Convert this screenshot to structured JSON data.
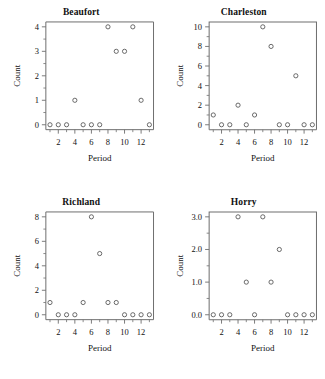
{
  "figure": {
    "layout": "2x2-panel-grid",
    "background": "#ffffff",
    "marker_color": "#5a5a5a",
    "axis_color": "#6e6e6e"
  },
  "chart_data": [
    {
      "type": "scatter",
      "title": "Beaufort",
      "xlabel": "Period",
      "ylabel": "Count",
      "x": [
        1,
        2,
        3,
        4,
        5,
        6,
        7,
        8,
        9,
        10,
        11,
        12,
        13
      ],
      "values": [
        0,
        0,
        0,
        1,
        0,
        0,
        0,
        4,
        3,
        3,
        4,
        1,
        0
      ],
      "xlim": [
        0.5,
        13.5
      ],
      "ylim": [
        -0.2,
        4.2
      ],
      "xticks": [
        2,
        4,
        6,
        8,
        10,
        12
      ],
      "xticklabels": [
        "2",
        "4",
        "6",
        "8",
        "10",
        "12"
      ],
      "xminorticks": [
        1,
        3,
        5,
        7,
        9,
        11,
        13
      ],
      "yticks": [
        0,
        1,
        2,
        3,
        4
      ],
      "yticklabels": [
        "0",
        "1",
        "2",
        "3",
        "4"
      ],
      "yminorticks": [
        0.5,
        1.5,
        2.5,
        3.5
      ],
      "grid": false,
      "legend": "none"
    },
    {
      "type": "scatter",
      "title": "Charleston",
      "xlabel": "Period",
      "ylabel": "Count",
      "x": [
        1,
        2,
        3,
        4,
        5,
        6,
        7,
        8,
        9,
        10,
        11,
        12,
        13
      ],
      "values": [
        1,
        0,
        0,
        2,
        0,
        1,
        10,
        8,
        0,
        0,
        5,
        0,
        0
      ],
      "xlim": [
        0.5,
        13.5
      ],
      "ylim": [
        -0.5,
        10.5
      ],
      "xticks": [
        2,
        4,
        6,
        8,
        10,
        12
      ],
      "xticklabels": [
        "2",
        "4",
        "6",
        "8",
        "10",
        "12"
      ],
      "xminorticks": [
        1,
        3,
        5,
        7,
        9,
        11,
        13
      ],
      "yticks": [
        0,
        2,
        4,
        6,
        8,
        10
      ],
      "yticklabels": [
        "0",
        "2",
        "4",
        "6",
        "8",
        "10"
      ],
      "yminorticks": [
        1,
        3,
        5,
        7,
        9
      ],
      "grid": false,
      "legend": "none"
    },
    {
      "type": "scatter",
      "title": "Richland",
      "xlabel": "Period",
      "ylabel": "Count",
      "x": [
        1,
        2,
        3,
        4,
        5,
        6,
        7,
        8,
        9,
        10,
        11,
        12,
        13
      ],
      "values": [
        1,
        0,
        0,
        0,
        1,
        8,
        5,
        1,
        1,
        0,
        0,
        0,
        0
      ],
      "xlim": [
        0.5,
        13.5
      ],
      "ylim": [
        -0.4,
        8.4
      ],
      "xticks": [
        2,
        4,
        6,
        8,
        10,
        12
      ],
      "xticklabels": [
        "2",
        "4",
        "6",
        "8",
        "10",
        "12"
      ],
      "xminorticks": [
        1,
        3,
        5,
        7,
        9,
        11,
        13
      ],
      "yticks": [
        0,
        2,
        4,
        6,
        8
      ],
      "yticklabels": [
        "0",
        "2",
        "4",
        "6",
        "8"
      ],
      "yminorticks": [
        1,
        3,
        5,
        7
      ],
      "grid": false,
      "legend": "none"
    },
    {
      "type": "scatter",
      "title": "Horry",
      "xlabel": "Period",
      "ylabel": "Count",
      "x": [
        1,
        2,
        3,
        4,
        5,
        6,
        7,
        8,
        9,
        10,
        11,
        12,
        13
      ],
      "values": [
        0,
        0,
        0,
        3,
        1,
        0,
        3,
        1,
        2,
        0,
        0,
        0,
        0
      ],
      "xlim": [
        0.5,
        13.5
      ],
      "ylim": [
        -0.15,
        3.15
      ],
      "xticks": [
        2,
        4,
        6,
        8,
        10,
        12
      ],
      "xticklabels": [
        "2",
        "4",
        "6",
        "8",
        "10",
        "12"
      ],
      "xminorticks": [
        1,
        3,
        5,
        7,
        9,
        11,
        13
      ],
      "yticks": [
        0,
        1,
        2,
        3
      ],
      "yticklabels": [
        "0.0",
        "1.0",
        "2.0",
        "3.0"
      ],
      "yminorticks": [
        0.5,
        1.5,
        2.5
      ],
      "grid": false,
      "legend": "none"
    }
  ]
}
